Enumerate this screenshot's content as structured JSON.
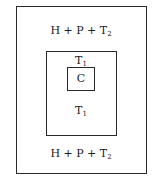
{
  "diagram": {
    "outer": {
      "label_top": {
        "base": "H + P + T",
        "sub": "2"
      },
      "label_bottom": {
        "base": "H + P + T",
        "sub": "2"
      }
    },
    "middle": {
      "label_top": {
        "base": "T",
        "sub": "1"
      },
      "label_bottom": {
        "base": "T",
        "sub": "1"
      }
    },
    "inner": {
      "label": "C"
    }
  }
}
